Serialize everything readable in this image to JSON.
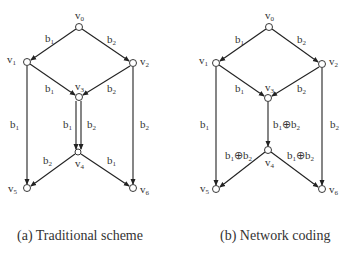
{
  "panels": [
    {
      "id": "a",
      "caption": "(a) Traditional scheme",
      "nodes": [
        {
          "name": "v0",
          "label": "v",
          "sub": "0"
        },
        {
          "name": "v1",
          "label": "v",
          "sub": "1"
        },
        {
          "name": "v2",
          "label": "v",
          "sub": "2"
        },
        {
          "name": "v3",
          "label": "v",
          "sub": "3"
        },
        {
          "name": "v4",
          "label": "v",
          "sub": "4"
        },
        {
          "name": "v5",
          "label": "v",
          "sub": "5"
        },
        {
          "name": "v6",
          "label": "v",
          "sub": "6"
        }
      ],
      "edges": [
        {
          "from": "v0",
          "to": "v1",
          "label": "b1"
        },
        {
          "from": "v0",
          "to": "v2",
          "label": "b2"
        },
        {
          "from": "v1",
          "to": "v3",
          "label": "b1"
        },
        {
          "from": "v2",
          "to": "v3",
          "label": "b2"
        },
        {
          "from": "v1",
          "to": "v5",
          "label": "b1"
        },
        {
          "from": "v2",
          "to": "v6",
          "label": "b2"
        },
        {
          "from": "v3",
          "to": "v4",
          "label": "b1"
        },
        {
          "from": "v3",
          "to": "v4",
          "label": "b2"
        },
        {
          "from": "v4",
          "to": "v5",
          "label": "b2"
        },
        {
          "from": "v4",
          "to": "v6",
          "label": "b1"
        }
      ]
    },
    {
      "id": "b",
      "caption": "(b) Network coding",
      "nodes": [
        {
          "name": "v0",
          "label": "v",
          "sub": "0"
        },
        {
          "name": "v1",
          "label": "v",
          "sub": "1"
        },
        {
          "name": "v2",
          "label": "v",
          "sub": "2"
        },
        {
          "name": "v3",
          "label": "v",
          "sub": "3"
        },
        {
          "name": "v4",
          "label": "v",
          "sub": "4"
        },
        {
          "name": "v5",
          "label": "v",
          "sub": "5"
        },
        {
          "name": "v6",
          "label": "v",
          "sub": "6"
        }
      ],
      "edges": [
        {
          "from": "v0",
          "to": "v1",
          "label": "b1"
        },
        {
          "from": "v0",
          "to": "v2",
          "label": "b2"
        },
        {
          "from": "v1",
          "to": "v3",
          "label": "b1"
        },
        {
          "from": "v2",
          "to": "v3",
          "label": "b2"
        },
        {
          "from": "v1",
          "to": "v5",
          "label": "b1"
        },
        {
          "from": "v2",
          "to": "v6",
          "label": "b2"
        },
        {
          "from": "v3",
          "to": "v4",
          "label": "b1⊕b2"
        },
        {
          "from": "v4",
          "to": "v5",
          "label": "b1⊕b2"
        },
        {
          "from": "v4",
          "to": "v6",
          "label": "b1⊕b2"
        }
      ]
    }
  ],
  "text": {
    "v": "v",
    "b": "b",
    "xor": "⊕",
    "s0": "0",
    "s1": "1",
    "s2": "2",
    "s3": "3",
    "s4": "4",
    "s5": "5",
    "s6": "6"
  }
}
